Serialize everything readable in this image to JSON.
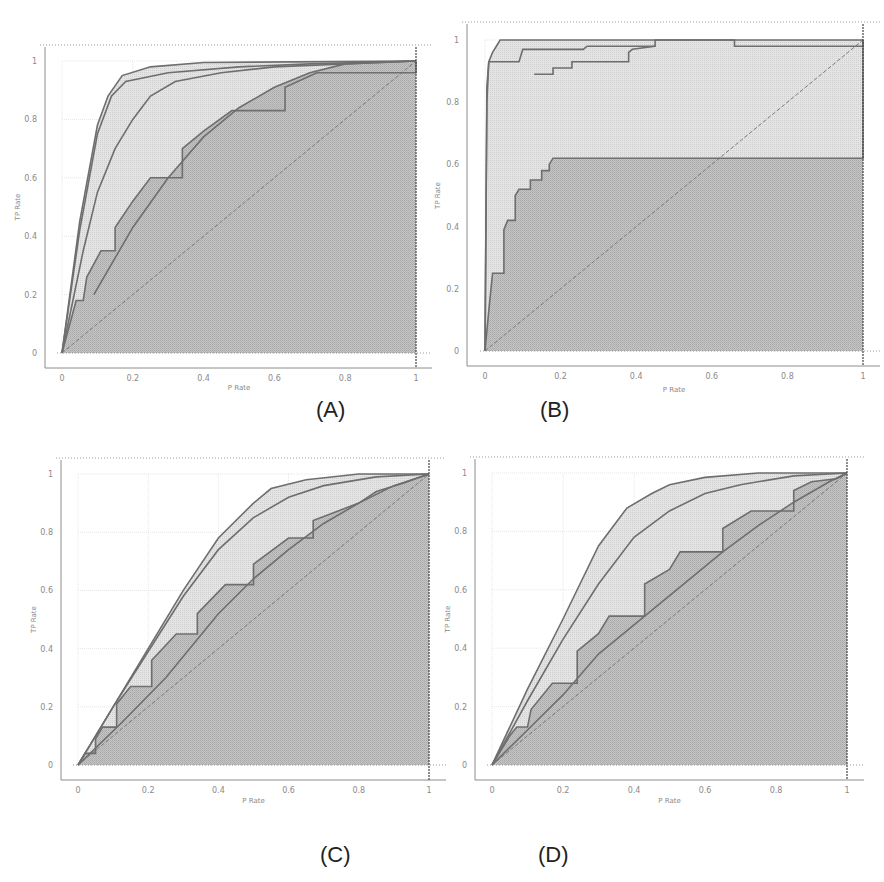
{
  "figure": {
    "colors": {
      "background": "#ffffff",
      "dark_fill": "#bdbdbd",
      "light_fill": "#dedede",
      "curve": "#6e6e6e",
      "grid": "#e6e6e6",
      "dotted": "#9a9a9a",
      "axis": "#8c8c8c"
    }
  },
  "chart_data": [
    {
      "id": "A",
      "type": "line",
      "panel_label": "(A)",
      "title": "",
      "xlabel": "P Rate",
      "ylabel": "TP Rate",
      "xlim": [
        0,
        1
      ],
      "ylim": [
        0,
        1
      ],
      "xticks": [
        "0",
        "0.2",
        "0.4",
        "0.6",
        "0.8",
        "1"
      ],
      "yticks": [
        "0",
        "0.2",
        "0.4",
        "0.6",
        "0.8",
        "1"
      ],
      "grid": true,
      "geometry": {
        "x0": 62,
        "x1": 416,
        "y0": 353,
        "y1": 61,
        "frameLeft": 45,
        "frameBottom": 368,
        "frameTop": 45,
        "frameRight": 432,
        "xlabelY": 390,
        "ylabelX": 20,
        "labelX": 330,
        "labelY": 410
      },
      "series": [
        {
          "name": "curve-1",
          "fill": "light",
          "points": [
            [
              0,
              0
            ],
            [
              0.05,
              0.45
            ],
            [
              0.1,
              0.78
            ],
            [
              0.13,
              0.88
            ],
            [
              0.17,
              0.95
            ],
            [
              0.25,
              0.98
            ],
            [
              0.4,
              0.995
            ],
            [
              1,
              1
            ]
          ]
        },
        {
          "name": "curve-2",
          "fill": "light",
          "points": [
            [
              0,
              0
            ],
            [
              0.05,
              0.42
            ],
            [
              0.1,
              0.75
            ],
            [
              0.14,
              0.88
            ],
            [
              0.18,
              0.93
            ],
            [
              0.3,
              0.96
            ],
            [
              0.5,
              0.98
            ],
            [
              0.7,
              0.99
            ],
            [
              1,
              1
            ]
          ]
        },
        {
          "name": "curve-3",
          "fill": "light",
          "points": [
            [
              0,
              0
            ],
            [
              0.06,
              0.35
            ],
            [
              0.1,
              0.55
            ],
            [
              0.15,
              0.7
            ],
            [
              0.2,
              0.8
            ],
            [
              0.25,
              0.88
            ],
            [
              0.32,
              0.93
            ],
            [
              0.45,
              0.96
            ],
            [
              0.6,
              0.98
            ],
            [
              1,
              1
            ]
          ]
        },
        {
          "name": "curve-4",
          "fill": "dark",
          "points": [
            [
              0,
              0
            ],
            [
              0.04,
              0.18
            ],
            [
              0.06,
              0.18
            ],
            [
              0.07,
              0.26
            ],
            [
              0.11,
              0.35
            ],
            [
              0.15,
              0.35
            ],
            [
              0.15,
              0.43
            ],
            [
              0.2,
              0.52
            ],
            [
              0.25,
              0.6
            ],
            [
              0.34,
              0.6
            ],
            [
              0.34,
              0.7
            ],
            [
              0.4,
              0.76
            ],
            [
              0.48,
              0.83
            ],
            [
              0.63,
              0.83
            ],
            [
              0.63,
              0.91
            ],
            [
              0.72,
              0.96
            ],
            [
              1,
              0.96
            ],
            [
              1,
              1
            ]
          ]
        },
        {
          "name": "curve-5",
          "fill": "dark",
          "points": [
            [
              0.09,
              0.2
            ],
            [
              0.2,
              0.43
            ],
            [
              0.3,
              0.6
            ],
            [
              0.4,
              0.74
            ],
            [
              0.5,
              0.84
            ],
            [
              0.6,
              0.91
            ],
            [
              0.7,
              0.96
            ],
            [
              0.8,
              0.99
            ],
            [
              1,
              1
            ]
          ]
        }
      ]
    },
    {
      "id": "B",
      "type": "line",
      "panel_label": "(B)",
      "title": "",
      "xlabel": "P Rate",
      "ylabel": "TP Rate",
      "xlim": [
        0,
        1
      ],
      "ylim": [
        0,
        1
      ],
      "xticks": [
        "0",
        "0.2",
        "0.4",
        "0.6",
        "0.8",
        "1"
      ],
      "yticks": [
        "0",
        "0.2",
        "0.4",
        "0.6",
        "0.8",
        "1"
      ],
      "grid": true,
      "geometry": {
        "x0": 485,
        "x1": 863,
        "y0": 351,
        "y1": 40,
        "frameLeft": 467,
        "frameBottom": 366,
        "frameTop": 22,
        "frameRight": 880,
        "xlabelY": 392,
        "ylabelX": 440,
        "labelX": 555,
        "labelY": 412
      },
      "series": [
        {
          "name": "curve-1",
          "fill": "light",
          "points": [
            [
              0,
              0
            ],
            [
              0.005,
              0.8
            ],
            [
              0.01,
              0.93
            ],
            [
              0.02,
              0.96
            ],
            [
              0.03,
              0.98
            ],
            [
              0.04,
              1
            ],
            [
              1,
              1
            ]
          ]
        },
        {
          "name": "curve-2",
          "fill": "light",
          "points": [
            [
              0,
              0
            ],
            [
              0.005,
              0.85
            ],
            [
              0.01,
              0.93
            ],
            [
              0.09,
              0.93
            ],
            [
              0.1,
              0.97
            ],
            [
              0.26,
              0.97
            ],
            [
              0.27,
              0.98
            ],
            [
              0.45,
              0.98
            ],
            [
              0.45,
              1
            ],
            [
              0.66,
              1
            ],
            [
              0.66,
              0.98
            ],
            [
              1,
              0.98
            ],
            [
              1,
              1
            ]
          ]
        },
        {
          "name": "curve-3",
          "fill": "light",
          "points": [
            [
              0.13,
              0.89
            ],
            [
              0.18,
              0.89
            ],
            [
              0.18,
              0.91
            ],
            [
              0.23,
              0.91
            ],
            [
              0.23,
              0.93
            ],
            [
              0.38,
              0.93
            ],
            [
              0.38,
              0.96
            ],
            [
              0.39,
              0.97
            ],
            [
              0.45,
              0.98
            ]
          ]
        },
        {
          "name": "curve-4",
          "fill": "dark",
          "points": [
            [
              0,
              0
            ],
            [
              0.01,
              0.13
            ],
            [
              0.02,
              0.25
            ],
            [
              0.05,
              0.25
            ],
            [
              0.05,
              0.39
            ],
            [
              0.06,
              0.42
            ],
            [
              0.08,
              0.42
            ],
            [
              0.08,
              0.5
            ],
            [
              0.09,
              0.52
            ],
            [
              0.12,
              0.52
            ],
            [
              0.12,
              0.55
            ],
            [
              0.15,
              0.55
            ],
            [
              0.15,
              0.58
            ],
            [
              0.17,
              0.58
            ],
            [
              0.17,
              0.6
            ],
            [
              0.18,
              0.62
            ],
            [
              1,
              0.62
            ],
            [
              1,
              1
            ]
          ]
        }
      ]
    },
    {
      "id": "C",
      "type": "line",
      "panel_label": "(C)",
      "title": "",
      "xlabel": "P Rate",
      "ylabel": "TP Rate",
      "xlim": [
        0,
        1
      ],
      "ylim": [
        0,
        1
      ],
      "xticks": [
        "0",
        "0.2",
        "0.4",
        "0.6",
        "0.8",
        "1"
      ],
      "yticks": [
        "0",
        "0.2",
        "0.4",
        "0.6",
        "0.8",
        "1"
      ],
      "grid": true,
      "geometry": {
        "x0": 78,
        "x1": 429,
        "y0": 765,
        "y1": 474,
        "frameLeft": 61,
        "frameBottom": 780,
        "frameTop": 458,
        "frameRight": 446,
        "xlabelY": 803,
        "ylabelX": 36,
        "labelX": 335,
        "labelY": 858
      },
      "series": [
        {
          "name": "curve-1",
          "fill": "light",
          "points": [
            [
              0,
              0
            ],
            [
              0.1,
              0.2
            ],
            [
              0.2,
              0.4
            ],
            [
              0.3,
              0.6
            ],
            [
              0.4,
              0.78
            ],
            [
              0.5,
              0.9
            ],
            [
              0.55,
              0.95
            ],
            [
              0.65,
              0.98
            ],
            [
              0.8,
              1
            ],
            [
              1,
              1
            ]
          ]
        },
        {
          "name": "curve-2",
          "fill": "light",
          "points": [
            [
              0,
              0
            ],
            [
              0.1,
              0.2
            ],
            [
              0.2,
              0.39
            ],
            [
              0.3,
              0.58
            ],
            [
              0.4,
              0.74
            ],
            [
              0.5,
              0.85
            ],
            [
              0.6,
              0.92
            ],
            [
              0.7,
              0.96
            ],
            [
              0.85,
              0.99
            ],
            [
              1,
              1
            ]
          ]
        },
        {
          "name": "curve-3",
          "fill": "dark",
          "points": [
            [
              0,
              0
            ],
            [
              0.02,
              0.04
            ],
            [
              0.05,
              0.04
            ],
            [
              0.05,
              0.09
            ],
            [
              0.07,
              0.13
            ],
            [
              0.11,
              0.13
            ],
            [
              0.11,
              0.21
            ],
            [
              0.15,
              0.27
            ],
            [
              0.21,
              0.27
            ],
            [
              0.21,
              0.36
            ],
            [
              0.28,
              0.45
            ],
            [
              0.34,
              0.45
            ],
            [
              0.34,
              0.52
            ],
            [
              0.42,
              0.62
            ],
            [
              0.5,
              0.62
            ],
            [
              0.5,
              0.69
            ],
            [
              0.6,
              0.78
            ],
            [
              0.67,
              0.78
            ],
            [
              0.67,
              0.84
            ],
            [
              0.8,
              0.9
            ],
            [
              0.85,
              0.94
            ],
            [
              0.93,
              0.97
            ],
            [
              1,
              1
            ]
          ]
        },
        {
          "name": "curve-4",
          "fill": "dark",
          "points": [
            [
              0,
              0
            ],
            [
              0.12,
              0.14
            ],
            [
              0.25,
              0.3
            ],
            [
              0.4,
              0.52
            ],
            [
              0.5,
              0.64
            ],
            [
              0.6,
              0.74
            ],
            [
              0.7,
              0.83
            ],
            [
              0.8,
              0.9
            ],
            [
              0.9,
              0.96
            ],
            [
              1,
              1
            ]
          ]
        }
      ]
    },
    {
      "id": "D",
      "type": "line",
      "panel_label": "(D)",
      "title": "",
      "xlabel": "P Rate",
      "ylabel": "TP Rate",
      "xlim": [
        0,
        1
      ],
      "ylim": [
        0,
        1
      ],
      "xticks": [
        "0",
        "0.2",
        "0.4",
        "0.6",
        "0.8",
        "1"
      ],
      "yticks": [
        "0",
        "0.2",
        "0.4",
        "0.6",
        "0.8",
        "1"
      ],
      "grid": true,
      "geometry": {
        "x0": 492,
        "x1": 847,
        "y0": 765,
        "y1": 473,
        "frameLeft": 475,
        "frameBottom": 780,
        "frameTop": 457,
        "frameRight": 864,
        "xlabelY": 803,
        "ylabelX": 450,
        "labelX": 555,
        "labelY": 858
      },
      "series": [
        {
          "name": "curve-1",
          "fill": "light",
          "points": [
            [
              0,
              0
            ],
            [
              0.1,
              0.26
            ],
            [
              0.2,
              0.5
            ],
            [
              0.3,
              0.75
            ],
            [
              0.38,
              0.88
            ],
            [
              0.45,
              0.93
            ],
            [
              0.5,
              0.96
            ],
            [
              0.6,
              0.985
            ],
            [
              0.75,
              1
            ],
            [
              1,
              1
            ]
          ]
        },
        {
          "name": "curve-2",
          "fill": "light",
          "points": [
            [
              0,
              0
            ],
            [
              0.1,
              0.22
            ],
            [
              0.2,
              0.43
            ],
            [
              0.3,
              0.62
            ],
            [
              0.4,
              0.78
            ],
            [
              0.5,
              0.87
            ],
            [
              0.6,
              0.93
            ],
            [
              0.7,
              0.96
            ],
            [
              0.85,
              0.99
            ],
            [
              1,
              1
            ]
          ]
        },
        {
          "name": "curve-3",
          "fill": "dark",
          "points": [
            [
              0,
              0
            ],
            [
              0.03,
              0.06
            ],
            [
              0.05,
              0.1
            ],
            [
              0.07,
              0.13
            ],
            [
              0.1,
              0.13
            ],
            [
              0.11,
              0.19
            ],
            [
              0.17,
              0.28
            ],
            [
              0.24,
              0.28
            ],
            [
              0.24,
              0.39
            ],
            [
              0.3,
              0.45
            ],
            [
              0.33,
              0.51
            ],
            [
              0.43,
              0.51
            ],
            [
              0.43,
              0.62
            ],
            [
              0.5,
              0.67
            ],
            [
              0.53,
              0.73
            ],
            [
              0.65,
              0.73
            ],
            [
              0.65,
              0.81
            ],
            [
              0.73,
              0.87
            ],
            [
              0.85,
              0.87
            ],
            [
              0.85,
              0.94
            ],
            [
              0.9,
              0.97
            ],
            [
              0.97,
              0.98
            ],
            [
              1,
              1
            ]
          ]
        },
        {
          "name": "curve-4",
          "fill": "dark",
          "points": [
            [
              0,
              0
            ],
            [
              0.1,
              0.12
            ],
            [
              0.2,
              0.24
            ],
            [
              0.3,
              0.38
            ],
            [
              0.43,
              0.51
            ],
            [
              0.55,
              0.63
            ],
            [
              0.65,
              0.73
            ],
            [
              0.75,
              0.82
            ],
            [
              0.85,
              0.9
            ],
            [
              0.95,
              0.97
            ],
            [
              1,
              1
            ]
          ]
        }
      ]
    }
  ]
}
